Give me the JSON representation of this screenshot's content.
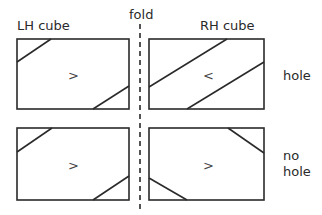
{
  "labels": {
    "lh_cube": "LH cube",
    "rh_cube": "RH cube",
    "fold": "fold",
    "hole": "hole",
    "no_hole_line1": "no",
    "no_hole_line2": "hole"
  },
  "panels": {
    "top_left": {
      "arrow": ">"
    },
    "top_right": {
      "arrow": "<"
    },
    "bottom_left": {
      "arrow": ">"
    },
    "bottom_right": {
      "arrow": ">"
    }
  },
  "colors": {
    "stroke": "#2a2a2a",
    "background": "#ffffff"
  }
}
